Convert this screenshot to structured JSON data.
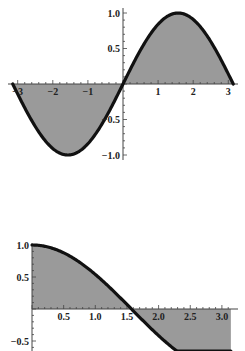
{
  "chart_data": [
    {
      "type": "area",
      "title": "",
      "function": "sin(x)",
      "xlabel": "",
      "ylabel": "",
      "xlim": [
        -3.14159,
        3.14159
      ],
      "ylim": [
        -1.0,
        1.0
      ],
      "x_ticks": [
        "-3",
        "-2",
        "-1",
        "1",
        "2",
        "3"
      ],
      "y_ticks": [
        "1.0",
        "0.5",
        "-0.5",
        "-1.0"
      ],
      "x": [
        -3.14,
        -2.5,
        -2.0,
        -1.5708,
        -1.0,
        -0.5,
        0,
        0.5,
        1.0,
        1.5708,
        2.0,
        2.5,
        3.14
      ],
      "values": [
        0,
        -0.6,
        -0.91,
        -1.0,
        -0.84,
        -0.48,
        0,
        0.48,
        0.84,
        1.0,
        0.91,
        0.6,
        0
      ],
      "fill": "to axis",
      "grid": false,
      "line_color": "#111111",
      "fill_color": "#9a9a9a"
    },
    {
      "type": "area",
      "title": "",
      "function": "cos(x)",
      "xlabel": "",
      "ylabel": "",
      "xlim": [
        0,
        3.14159
      ],
      "ylim": [
        -0.6,
        1.0
      ],
      "x_ticks": [
        "0.5",
        "1.0",
        "1.5",
        "2.0",
        "2.5",
        "3.0"
      ],
      "y_ticks": [
        "1.0",
        "0.5",
        "-0.5"
      ],
      "x": [
        0,
        0.5,
        1.0,
        1.5708,
        2.0,
        2.5,
        3.14
      ],
      "values": [
        1.0,
        0.88,
        0.54,
        0,
        -0.42,
        -0.8,
        -1.0
      ],
      "fill": "to axis",
      "grid": false,
      "line_color": "#111111",
      "fill_color": "#9a9a9a"
    }
  ]
}
